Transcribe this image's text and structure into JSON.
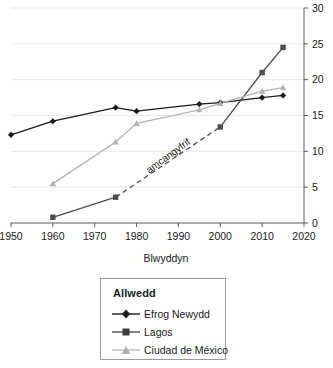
{
  "chart_data": {
    "type": "line",
    "title": "",
    "xlabel": "Blwyddyn",
    "ylabel": "",
    "xlim": [
      1950,
      2020
    ],
    "ylim": [
      0,
      30
    ],
    "xticks": [
      1950,
      1960,
      1970,
      1980,
      1990,
      2000,
      2010,
      2020
    ],
    "yticks": [
      0,
      5,
      10,
      15,
      20,
      25,
      30
    ],
    "y_axis_position": "right",
    "grid": true,
    "grid_axis": "y",
    "legend_position": "below-plot",
    "legend_title": "Allwedd",
    "series": [
      {
        "name": "Efrog Newydd",
        "color": "#1a1a1a",
        "marker": "diamond",
        "x": [
          1950,
          1960,
          1975,
          1980,
          1995,
          2000,
          2010,
          2015
        ],
        "values": [
          12.3,
          14.2,
          16.1,
          15.6,
          16.6,
          16.8,
          17.5,
          17.8
        ],
        "dashed_from": null
      },
      {
        "name": "Lagos",
        "color": "#4d4d4d",
        "marker": "square",
        "x": [
          1960,
          1975,
          2000,
          2010,
          2015
        ],
        "values": [
          0.8,
          3.6,
          13.4,
          21.0,
          24.5
        ],
        "dashed_from": 1975,
        "dashed_to": 2000
      },
      {
        "name": "Ciudad de México",
        "color": "#b3b3b3",
        "marker": "triangle",
        "x": [
          1960,
          1975,
          1980,
          1995,
          2000,
          2010,
          2015
        ],
        "values": [
          5.5,
          11.3,
          13.9,
          15.8,
          16.7,
          18.4,
          18.9
        ],
        "dashed_from": null
      }
    ],
    "annotations": [
      {
        "text": "amcangyfrif",
        "x": 1988,
        "y": 9.0,
        "rotation": -36
      }
    ]
  },
  "legend": {
    "title": "Allwedd",
    "items": [
      {
        "label": "Efrog Newydd"
      },
      {
        "label": "Lagos"
      },
      {
        "label": "Ciudad de México"
      }
    ]
  },
  "axis": {
    "x_title": "Blwyddyn",
    "x_tick_labels": [
      "1950",
      "1960",
      "1970",
      "1980",
      "1990",
      "2000",
      "2010",
      "2020"
    ],
    "y_tick_labels": [
      "0",
      "5",
      "10",
      "15",
      "20",
      "25",
      "30"
    ]
  }
}
